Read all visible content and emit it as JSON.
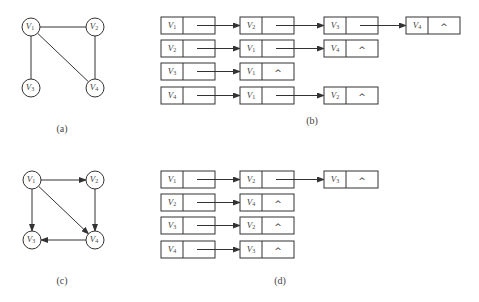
{
  "figures": {
    "a": {
      "caption": "(a)",
      "type": "undirected-graph",
      "vertices": [
        {
          "id": "V1",
          "base": "V",
          "sub": "1",
          "x": 31,
          "y": 27
        },
        {
          "id": "V2",
          "base": "V",
          "sub": "2",
          "x": 95,
          "y": 27
        },
        {
          "id": "V3",
          "base": "V",
          "sub": "3",
          "x": 31,
          "y": 88
        },
        {
          "id": "V4",
          "base": "V",
          "sub": "4",
          "x": 95,
          "y": 88
        }
      ],
      "edges": [
        [
          "V1",
          "V2"
        ],
        [
          "V1",
          "V3"
        ],
        [
          "V1",
          "V4"
        ],
        [
          "V2",
          "V4"
        ]
      ]
    },
    "b": {
      "caption": "(b)",
      "type": "adjacency-list",
      "rows": [
        {
          "head": {
            "base": "V",
            "sub": "1"
          },
          "list": [
            {
              "base": "V",
              "sub": "2"
            },
            {
              "base": "V",
              "sub": "3"
            },
            {
              "base": "V",
              "sub": "4"
            }
          ]
        },
        {
          "head": {
            "base": "V",
            "sub": "2"
          },
          "list": [
            {
              "base": "V",
              "sub": "1"
            },
            {
              "base": "V",
              "sub": "4"
            }
          ]
        },
        {
          "head": {
            "base": "V",
            "sub": "3"
          },
          "list": [
            {
              "base": "V",
              "sub": "1"
            }
          ]
        },
        {
          "head": {
            "base": "V",
            "sub": "4"
          },
          "list": [
            {
              "base": "V",
              "sub": "1"
            },
            {
              "base": "V",
              "sub": "2"
            }
          ]
        }
      ]
    },
    "c": {
      "caption": "(c)",
      "type": "directed-graph",
      "vertices": [
        {
          "id": "V1",
          "base": "V",
          "sub": "1",
          "x": 32,
          "y": 180
        },
        {
          "id": "V2",
          "base": "V",
          "sub": "2",
          "x": 95,
          "y": 180
        },
        {
          "id": "V3",
          "base": "V",
          "sub": "3",
          "x": 32,
          "y": 240
        },
        {
          "id": "V4",
          "base": "V",
          "sub": "4",
          "x": 95,
          "y": 240
        }
      ],
      "edges": [
        [
          "V1",
          "V2"
        ],
        [
          "V1",
          "V3"
        ],
        [
          "V1",
          "V4"
        ],
        [
          "V2",
          "V4"
        ],
        [
          "V4",
          "V3"
        ]
      ]
    },
    "d": {
      "caption": "(d)",
      "type": "adjacency-list",
      "rows": [
        {
          "head": {
            "base": "V",
            "sub": "1"
          },
          "list": [
            {
              "base": "V",
              "sub": "2"
            },
            {
              "base": "V",
              "sub": "3"
            }
          ]
        },
        {
          "head": {
            "base": "V",
            "sub": "2"
          },
          "list": [
            {
              "base": "V",
              "sub": "4"
            }
          ]
        },
        {
          "head": {
            "base": "V",
            "sub": "3"
          },
          "list": [
            {
              "base": "V",
              "sub": "2"
            }
          ]
        },
        {
          "head": {
            "base": "V",
            "sub": "4"
          },
          "list": [
            {
              "base": "V",
              "sub": "3"
            }
          ]
        }
      ]
    }
  },
  "null_symbol": "^",
  "colors": {
    "stroke": "#333333",
    "text": "#444444",
    "background": "#ffffff"
  }
}
